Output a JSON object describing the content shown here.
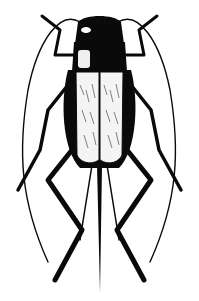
{
  "image": {
    "subject": "cricket illustration",
    "style": "black and white line drawing",
    "colors": {
      "ink": "#0a0a0a",
      "paper": "#ffffff",
      "wing_fill": "#f4f4f4"
    }
  }
}
